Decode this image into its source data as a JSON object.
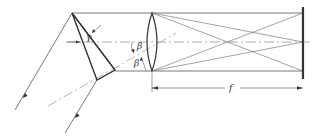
{
  "diagram": {
    "type": "optical-schematic",
    "labels": {
      "gamma": "γ",
      "beta_upper": "β",
      "beta_lower": "β",
      "focal_length": "f"
    },
    "components": [
      {
        "name": "prism",
        "apex": [
          72,
          13
        ],
        "vertices": [
          [
            72,
            13
          ],
          [
            97,
            80
          ],
          [
            115,
            70
          ]
        ]
      },
      {
        "name": "lens",
        "center_x": 152,
        "top_y": 13,
        "bottom_y": 71
      },
      {
        "name": "screen",
        "x": 303,
        "top_y": 7,
        "bottom_y": 79
      }
    ],
    "colors": {
      "line": "#555555",
      "thick_line": "#333333",
      "background": "#ffffff"
    }
  }
}
